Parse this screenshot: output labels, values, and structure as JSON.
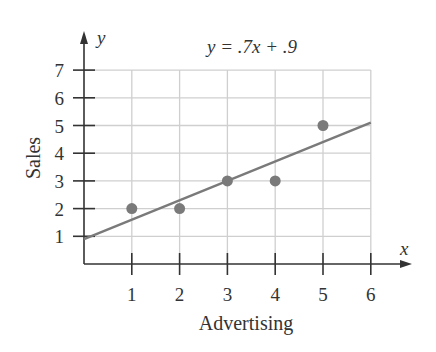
{
  "chart_data": {
    "type": "scatter",
    "title": "y = .7x + .9",
    "xlabel": "Advertising",
    "ylabel": "Sales",
    "x_axis_symbol": "x",
    "y_axis_symbol": "y",
    "xlim": [
      0,
      6
    ],
    "ylim": [
      0,
      7
    ],
    "x_ticks": [
      1,
      2,
      3,
      4,
      5,
      6
    ],
    "y_ticks": [
      1,
      2,
      3,
      4,
      5,
      6,
      7
    ],
    "grid": true,
    "series": [
      {
        "name": "data points",
        "type": "scatter",
        "points": [
          {
            "x": 1,
            "y": 2
          },
          {
            "x": 2,
            "y": 2
          },
          {
            "x": 3,
            "y": 3
          },
          {
            "x": 4,
            "y": 3
          },
          {
            "x": 5,
            "y": 5
          }
        ]
      },
      {
        "name": "regression line",
        "type": "line",
        "equation": "y = .7x + .9",
        "slope": 0.7,
        "intercept": 0.9,
        "x_range": [
          0,
          6
        ]
      }
    ],
    "legend": null
  },
  "colors": {
    "axis": "#333333",
    "grid": "#cfcfcf",
    "points": "#7a7a7a",
    "line": "#7a7a7a",
    "text": "#333333"
  }
}
